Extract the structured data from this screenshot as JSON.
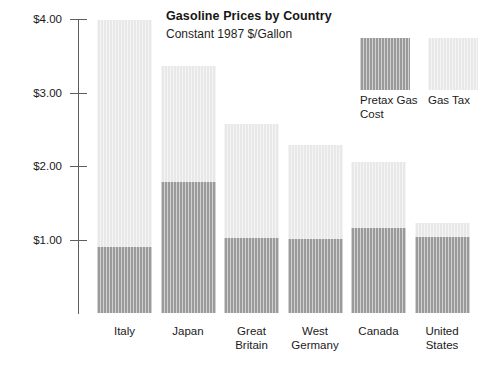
{
  "chart_data": {
    "type": "bar",
    "subtype": "stacked-vertical",
    "title": "Gasoline Prices by Country",
    "subtitle": "Constant 1987 $/Gallon",
    "xlabel": "",
    "ylabel": "",
    "ylim": [
      0,
      4.0
    ],
    "ytick_values": [
      4.0,
      3.0,
      2.0,
      1.0
    ],
    "ytick_labels": [
      "$4.00",
      "$3.00",
      "$2.00",
      "$1.00"
    ],
    "grid": false,
    "legend_position": "upper-right",
    "categories": [
      "Italy",
      "Japan",
      "Great Britain",
      "West Germany",
      "Canada",
      "United States"
    ],
    "category_labels": [
      [
        "Italy"
      ],
      [
        "Japan"
      ],
      [
        "Great",
        "Britain"
      ],
      [
        "West",
        "Germany"
      ],
      [
        "Canada"
      ],
      [
        "United",
        "States"
      ]
    ],
    "series": [
      {
        "name": "Pretax Gas Cost",
        "color": "#9a9a9a",
        "values": [
          0.9,
          1.78,
          1.02,
          1.0,
          1.15,
          1.03
        ]
      },
      {
        "name": "Gas Tax",
        "color": "#e8e8e8",
        "values": [
          3.09,
          1.58,
          1.55,
          1.29,
          0.9,
          0.19
        ]
      }
    ],
    "totals": [
      3.99,
      3.36,
      2.57,
      2.29,
      2.05,
      1.22
    ],
    "colors": {
      "pretax": "#9a9a9a",
      "tax": "#e8e8e8",
      "axis": "#5e5e5e",
      "text": "#1a1a1a",
      "background": "#ffffff"
    }
  },
  "legend": {
    "entries": [
      {
        "label_lines": [
          "Pretax Gas",
          "Cost"
        ],
        "swatch": "pretax-swatch"
      },
      {
        "label_lines": [
          "Gas Tax"
        ],
        "swatch": "tax-swatch"
      }
    ]
  }
}
